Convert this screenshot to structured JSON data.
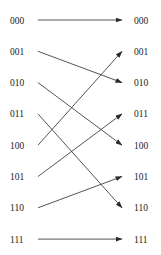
{
  "diagram": {
    "type": "perfect-shuffle-permutation",
    "left_nodes": [
      "000",
      "001",
      "010",
      "011",
      "100",
      "101",
      "110",
      "111"
    ],
    "right_nodes": [
      "000",
      "001",
      "010",
      "011",
      "100",
      "101",
      "110",
      "111"
    ],
    "edges": [
      {
        "from": "000",
        "to": "000"
      },
      {
        "from": "001",
        "to": "010"
      },
      {
        "from": "010",
        "to": "100"
      },
      {
        "from": "011",
        "to": "110"
      },
      {
        "from": "100",
        "to": "001"
      },
      {
        "from": "101",
        "to": "011"
      },
      {
        "from": "110",
        "to": "101"
      },
      {
        "from": "111",
        "to": "111"
      }
    ]
  }
}
